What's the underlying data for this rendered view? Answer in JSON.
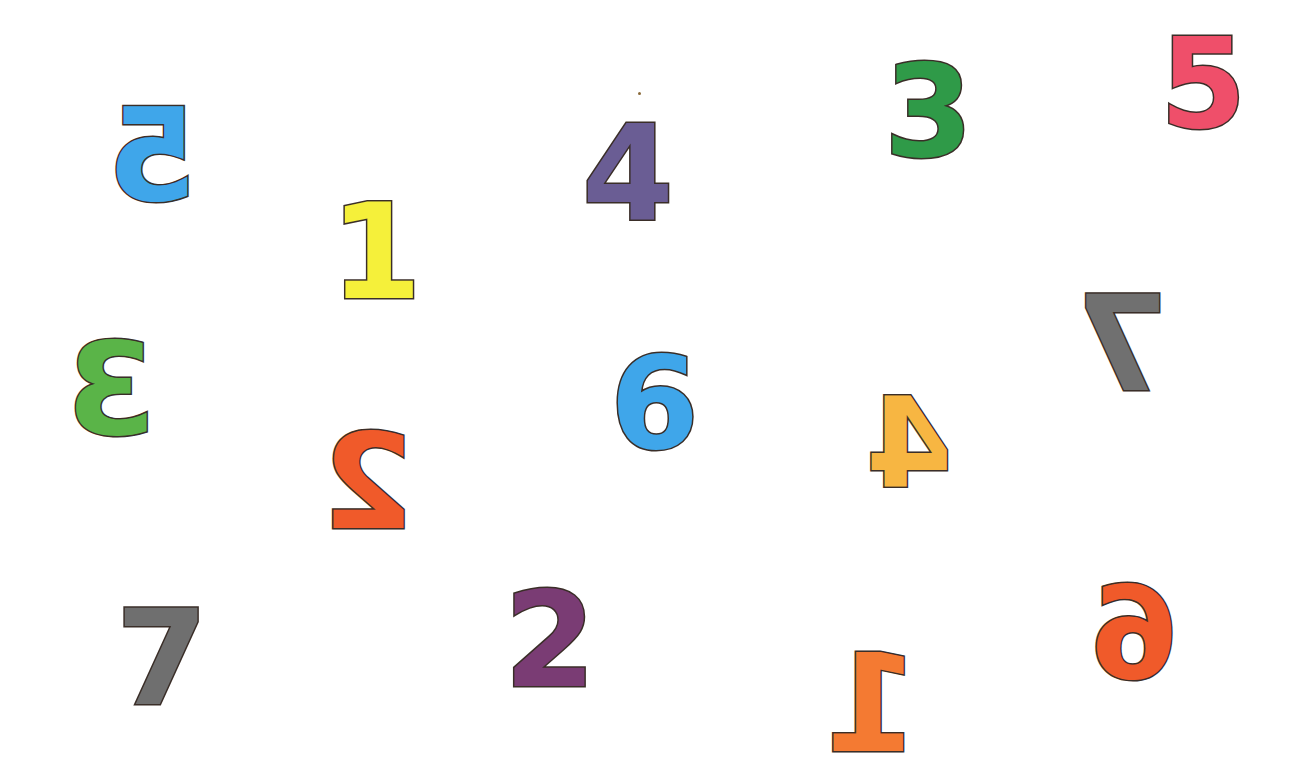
{
  "digits": [
    {
      "id": "blue-5-mirrored",
      "value": "5",
      "mirrored": true,
      "color": "#3fa6ea",
      "x": 108,
      "y": 92,
      "size": 128
    },
    {
      "id": "yellow-1",
      "value": "1",
      "mirrored": false,
      "color": "#f5f03a",
      "x": 330,
      "y": 186,
      "size": 132
    },
    {
      "id": "purple-4",
      "value": "4",
      "mirrored": false,
      "color": "#6a5d94",
      "x": 582,
      "y": 108,
      "size": 132
    },
    {
      "id": "green-3",
      "value": "3",
      "mirrored": false,
      "color": "#2f9a48",
      "x": 884,
      "y": 48,
      "size": 128
    },
    {
      "id": "pink-5",
      "value": "5",
      "mirrored": false,
      "color": "#ef4f6a",
      "x": 1160,
      "y": 22,
      "size": 124
    },
    {
      "id": "gray-7-mirrored",
      "value": "7",
      "mirrored": true,
      "color": "#707070",
      "x": 1076,
      "y": 278,
      "size": 132
    },
    {
      "id": "green-3-mirrored",
      "value": "3",
      "mirrored": true,
      "color": "#5ab448",
      "x": 66,
      "y": 326,
      "size": 128
    },
    {
      "id": "blue-6",
      "value": "6",
      "mirrored": false,
      "color": "#3fa6ea",
      "x": 610,
      "y": 340,
      "size": 128
    },
    {
      "id": "yellow-4-mirrored",
      "value": "4",
      "mirrored": true,
      "color": "#f7b642",
      "x": 866,
      "y": 382,
      "size": 124
    },
    {
      "id": "red-2-mirrored",
      "value": "2",
      "mirrored": true,
      "color": "#f05a2a",
      "x": 322,
      "y": 416,
      "size": 132
    },
    {
      "id": "gray-7",
      "value": "7",
      "mirrored": false,
      "color": "#6f6f6f",
      "x": 116,
      "y": 592,
      "size": 132
    },
    {
      "id": "purple-2",
      "value": "2",
      "mirrored": false,
      "color": "#7a3c74",
      "x": 504,
      "y": 574,
      "size": 132
    },
    {
      "id": "orange-1-mirrored",
      "value": "1",
      "mirrored": true,
      "color": "#f47a32",
      "x": 824,
      "y": 636,
      "size": 136
    },
    {
      "id": "orange-6-mirrored",
      "value": "6",
      "mirrored": true,
      "color": "#f05a2a",
      "x": 1090,
      "y": 570,
      "size": 128
    }
  ]
}
